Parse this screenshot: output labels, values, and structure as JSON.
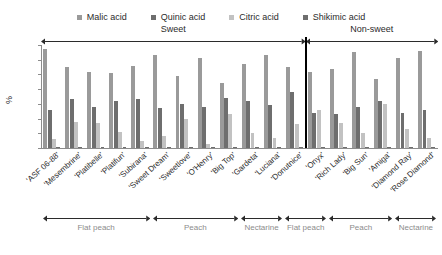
{
  "chart_data": {
    "type": "bar",
    "title": "",
    "xlabel": "",
    "ylabel": "%",
    "ylim": [
      0,
      70
    ],
    "yticks": [
      0,
      10,
      20,
      30,
      40,
      50,
      60,
      70
    ],
    "grid": false,
    "legend_position": "top-center",
    "categories": [
      "'ASF 06-88'",
      "'Mesembrine'",
      "'Platibelle'",
      "'Platifun'",
      "'Subirana'",
      "'Sweet Dream'",
      "'Sweetlove'",
      "'O'Henry'",
      "'Big Top'",
      "'Gardeta'",
      "'Luciana'",
      "'Donutnice'",
      "'Onyx'",
      "'Rich Lady'",
      "'Big Sun'",
      "'Amiga'",
      "'Diamond Ray'",
      "'Rose Diamond'"
    ],
    "series": [
      {
        "name": "Malic acid",
        "color": "#9a9a9a",
        "values": [
          67,
          55,
          52,
          51,
          56,
          63,
          49,
          61,
          44,
          57,
          63,
          55,
          52,
          54,
          65,
          47,
          61,
          66
        ]
      },
      {
        "name": "Quinic acid",
        "color": "#6e6e6e",
        "values": [
          26,
          33,
          28,
          32,
          33,
          27,
          30,
          28,
          34,
          32,
          29,
          38,
          24,
          23,
          28,
          32,
          24,
          26
        ]
      },
      {
        "name": "Citric acid",
        "color": "#c2c2c2",
        "values": [
          6,
          18,
          17,
          11,
          5,
          8,
          20,
          3,
          23,
          10,
          7,
          16,
          26,
          17,
          10,
          30,
          13,
          7
        ]
      },
      {
        "name": "Shikimic acid",
        "color": "#6e6e6e",
        "values": [
          0.4,
          0.4,
          0.4,
          0.4,
          0.4,
          0.4,
          0.4,
          0.4,
          0.4,
          0.4,
          0.4,
          0.4,
          0.4,
          0.4,
          0.4,
          0.4,
          0.4,
          0.4
        ]
      }
    ],
    "top_spans": [
      {
        "label": "Sweet",
        "start_index": 0,
        "end_index": 11
      },
      {
        "label": "Non-sweet",
        "start_index": 12,
        "end_index": 17
      }
    ],
    "bottom_spans": [
      {
        "label": "Flat peach",
        "start_index": 0,
        "end_index": 4
      },
      {
        "label": "Peach",
        "start_index": 5,
        "end_index": 8
      },
      {
        "label": "Nectarine",
        "start_index": 9,
        "end_index": 10
      },
      {
        "label": "Flat peach",
        "start_index": 11,
        "end_index": 12
      },
      {
        "label": "Peach",
        "start_index": 13,
        "end_index": 15
      },
      {
        "label": "Nectarine",
        "start_index": 16,
        "end_index": 17
      }
    ],
    "axis_color": "#8c8c8c",
    "divider_color": "#000000",
    "annotation_color": "#8c8c8c"
  }
}
